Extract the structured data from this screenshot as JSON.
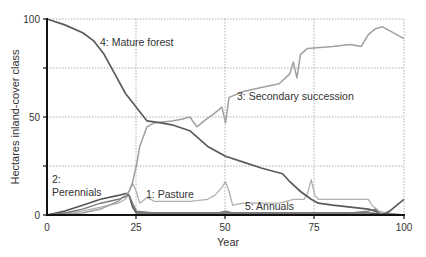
{
  "chart_data": {
    "type": "line",
    "title": "",
    "xlabel": "Year",
    "ylabel": "Hectares inland-cover class",
    "xlim": [
      0,
      100
    ],
    "ylim": [
      0,
      100
    ],
    "x_ticks": [
      "0",
      "25",
      "50",
      "75",
      "100"
    ],
    "y_ticks": [
      "0",
      "50",
      "100"
    ],
    "grid": true,
    "legend_position": "inline labels",
    "series": [
      {
        "name": "1: Pasture",
        "color": "#b0b0b0",
        "points": [
          [
            0,
            0
          ],
          [
            5,
            1
          ],
          [
            10,
            2
          ],
          [
            15,
            4
          ],
          [
            20,
            6
          ],
          [
            22,
            8
          ],
          [
            23,
            12
          ],
          [
            24,
            16
          ],
          [
            25,
            12
          ],
          [
            26,
            6
          ],
          [
            28,
            9
          ],
          [
            30,
            7
          ],
          [
            35,
            7
          ],
          [
            40,
            7
          ],
          [
            45,
            8
          ],
          [
            47,
            10
          ],
          [
            49,
            14
          ],
          [
            50,
            17
          ],
          [
            51,
            12
          ],
          [
            52,
            5
          ],
          [
            55,
            6
          ],
          [
            60,
            6
          ],
          [
            65,
            6
          ],
          [
            67,
            7
          ],
          [
            69,
            8
          ],
          [
            72,
            8
          ],
          [
            73,
            11
          ],
          [
            74,
            18
          ],
          [
            75,
            10
          ],
          [
            76,
            8
          ],
          [
            80,
            8
          ],
          [
            85,
            8
          ],
          [
            90,
            8
          ],
          [
            91,
            5
          ],
          [
            93,
            2
          ],
          [
            95,
            1
          ],
          [
            100,
            0
          ]
        ]
      },
      {
        "name": "2: Perennials",
        "color": "#555555",
        "points": [
          [
            0,
            0
          ],
          [
            5,
            2
          ],
          [
            10,
            5
          ],
          [
            15,
            8
          ],
          [
            20,
            10
          ],
          [
            22,
            11
          ],
          [
            23,
            10
          ],
          [
            24,
            4
          ],
          [
            25,
            1
          ],
          [
            30,
            1
          ],
          [
            40,
            1
          ],
          [
            50,
            1
          ],
          [
            60,
            1
          ],
          [
            70,
            1
          ],
          [
            75,
            1
          ],
          [
            80,
            1
          ],
          [
            90,
            1
          ],
          [
            100,
            0
          ]
        ]
      },
      {
        "name": "3: Secondary succession",
        "color": "#a0a0a0",
        "points": [
          [
            0,
            0
          ],
          [
            10,
            1
          ],
          [
            15,
            3
          ],
          [
            20,
            7
          ],
          [
            23,
            12
          ],
          [
            24,
            17
          ],
          [
            25,
            25
          ],
          [
            26,
            35
          ],
          [
            27,
            40
          ],
          [
            28,
            45
          ],
          [
            30,
            47
          ],
          [
            35,
            48
          ],
          [
            38,
            49
          ],
          [
            40,
            50
          ],
          [
            42,
            45
          ],
          [
            44,
            48
          ],
          [
            47,
            52
          ],
          [
            49,
            55
          ],
          [
            50,
            47
          ],
          [
            51,
            60
          ],
          [
            55,
            63
          ],
          [
            60,
            65
          ],
          [
            65,
            67
          ],
          [
            68,
            72
          ],
          [
            69,
            78
          ],
          [
            70,
            70
          ],
          [
            71,
            82
          ],
          [
            73,
            85
          ],
          [
            80,
            86
          ],
          [
            85,
            87
          ],
          [
            88,
            86
          ],
          [
            90,
            92
          ],
          [
            92,
            95
          ],
          [
            94,
            96
          ],
          [
            100,
            90
          ]
        ]
      },
      {
        "name": "4: Mature forest",
        "color": "#5a5a5a",
        "points": [
          [
            0,
            100
          ],
          [
            5,
            97
          ],
          [
            10,
            93
          ],
          [
            13,
            89
          ],
          [
            16,
            82
          ],
          [
            19,
            72
          ],
          [
            22,
            62
          ],
          [
            25,
            55
          ],
          [
            28,
            48
          ],
          [
            32,
            47
          ],
          [
            35,
            46
          ],
          [
            40,
            43
          ],
          [
            45,
            35
          ],
          [
            50,
            30
          ],
          [
            55,
            27
          ],
          [
            60,
            24
          ],
          [
            66,
            21
          ],
          [
            68,
            17
          ],
          [
            71,
            12
          ],
          [
            74,
            8
          ],
          [
            76,
            6
          ],
          [
            80,
            5
          ],
          [
            85,
            4
          ],
          [
            90,
            3
          ],
          [
            92,
            2
          ],
          [
            94,
            0
          ],
          [
            96,
            2
          ],
          [
            98,
            5
          ],
          [
            100,
            8
          ]
        ]
      },
      {
        "name": "5: Annuals",
        "color": "#7a7a7a",
        "points": [
          [
            0,
            0
          ],
          [
            5,
            1
          ],
          [
            10,
            3
          ],
          [
            15,
            6
          ],
          [
            20,
            8
          ],
          [
            23,
            10
          ],
          [
            24,
            6
          ],
          [
            25,
            2
          ],
          [
            30,
            1
          ],
          [
            40,
            1
          ],
          [
            48,
            1
          ],
          [
            50,
            2
          ],
          [
            52,
            1
          ],
          [
            60,
            1
          ],
          [
            65,
            1
          ],
          [
            70,
            1
          ],
          [
            75,
            1
          ],
          [
            80,
            1
          ],
          [
            85,
            1
          ],
          [
            90,
            2
          ],
          [
            92,
            3
          ],
          [
            93,
            1
          ],
          [
            95,
            0
          ],
          [
            100,
            0
          ]
        ]
      }
    ],
    "annotations": [
      {
        "text": "4: Mature forest",
        "x_px": 100,
        "y_px": 46
      },
      {
        "text": "3: Secondary succession",
        "x_px": 237,
        "y_px": 100
      },
      {
        "text": "2:",
        "x_px": 52,
        "y_px": 183
      },
      {
        "text": "Perennials",
        "x_px": 52,
        "y_px": 196
      },
      {
        "text": "1: Pasture",
        "x_px": 146,
        "y_px": 198
      },
      {
        "text": "5: Annuals",
        "x_px": 245,
        "y_px": 210
      }
    ]
  },
  "axes": {
    "x_title": "Year",
    "y_title": "Hectares inland-cover class",
    "x_ticks": [
      "0",
      "25",
      "50",
      "75",
      "100"
    ],
    "y_ticks": [
      "0",
      "50",
      "100"
    ]
  },
  "labels": {
    "mature_forest": "4: Mature forest",
    "secondary_succession": "3: Secondary succession",
    "perennials_num": "2:",
    "perennials_name": "Perennials",
    "pasture": "1: Pasture",
    "annuals": "5: Annuals"
  }
}
